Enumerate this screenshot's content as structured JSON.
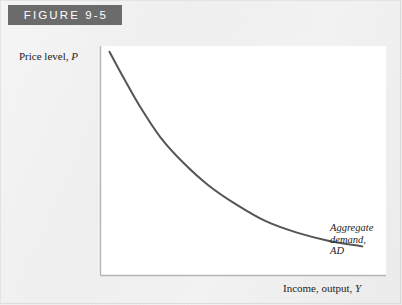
{
  "figure": {
    "header_label": "FIGURE 9-5",
    "header_bg_color": "#6b6b6b",
    "header_text_color": "#ffffff",
    "page_bg_color": "#f2f2f2",
    "plot_bg_color": "#ffffff"
  },
  "axes": {
    "y_label_text": "Price level,",
    "y_label_variable": "P",
    "x_label_text": "Income, output,",
    "x_label_variable": "Y",
    "axis_color": "#b5b5b5"
  },
  "annotation": {
    "line1": "Aggregate",
    "line2": "demand,",
    "line3": "AD"
  },
  "chart_data": {
    "type": "line",
    "title": "FIGURE 9-5",
    "xlabel": "Income, output, Y",
    "ylabel": "Price level, P",
    "grid": false,
    "legend": "none",
    "curve_color": "#555555",
    "curve_width": 2,
    "series": [
      {
        "name": "Aggregate demand, AD",
        "shape": "downward-sloping hyperbola",
        "x": [
          0.03,
          0.08,
          0.14,
          0.21,
          0.29,
          0.38,
          0.48,
          0.58,
          0.69,
          0.8,
          0.92
        ],
        "y": [
          0.975,
          0.86,
          0.73,
          0.6,
          0.49,
          0.39,
          0.305,
          0.235,
          0.185,
          0.15,
          0.125
        ]
      }
    ],
    "xlim": [
      0,
      1
    ],
    "ylim": [
      0,
      1
    ],
    "axis_tick_labels": []
  }
}
